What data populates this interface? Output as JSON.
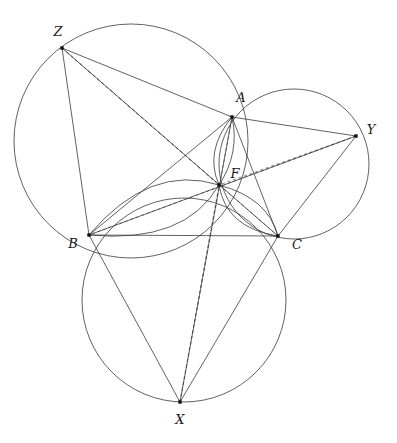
{
  "figure": {
    "width": 397,
    "height": 443,
    "background_color": "#ffffff",
    "stroke_color": "#3a3a3a",
    "dashed_color": "#6a6a6a",
    "vertex_color": "#111111"
  },
  "points": {
    "A": {
      "label": "A",
      "x": 232,
      "y": 117,
      "label_x": 241,
      "label_y": 98
    },
    "B": {
      "label": "B",
      "x": 89,
      "y": 235,
      "label_x": 73,
      "label_y": 244
    },
    "C": {
      "label": "C",
      "x": 278,
      "y": 236,
      "label_x": 297,
      "label_y": 245
    },
    "X": {
      "label": "X",
      "x": 180,
      "y": 402,
      "label_x": 180,
      "label_y": 420
    },
    "Y": {
      "label": "Y",
      "x": 356,
      "y": 136,
      "label_x": 371,
      "label_y": 130
    },
    "Z": {
      "label": "Z",
      "x": 62,
      "y": 48,
      "label_x": 58,
      "label_y": 32
    },
    "F": {
      "label": "F",
      "x": 219,
      "y": 185,
      "label_x": 235,
      "label_y": 174
    }
  },
  "circles": [
    {
      "name": "circumcircle-ABZ",
      "cx": 131,
      "cy": 141,
      "r": 117
    },
    {
      "name": "circumcircle-ACY",
      "cx": 294,
      "cy": 164,
      "r": 75
    },
    {
      "name": "circumcircle-BCX",
      "cx": 184,
      "cy": 300,
      "r": 102
    }
  ],
  "arcs": [
    {
      "name": "arc-BF-upper",
      "d": "M 89 235 Q 150 163 219 185"
    },
    {
      "name": "arc-BF-lower",
      "d": "M 89 235 Q 185 244 219 185"
    },
    {
      "name": "arc-FC-upper",
      "d": "M 219 185 Q 268 198 278 236"
    },
    {
      "name": "arc-FC-lower",
      "d": "M 219 185 Q 226 228 278 236"
    },
    {
      "name": "arc-AF-left",
      "d": "M 232 117 Q 204 151 219 185"
    },
    {
      "name": "arc-AF-right",
      "d": "M 232 117 Q 240 153 219 185"
    }
  ],
  "solid_segments": [
    {
      "name": "segment-AB",
      "from": "A",
      "to": "B"
    },
    {
      "name": "segment-BC",
      "from": "B",
      "to": "C"
    },
    {
      "name": "segment-CA",
      "from": "C",
      "to": "A"
    },
    {
      "name": "segment-ZA",
      "from": "Z",
      "to": "A"
    },
    {
      "name": "segment-ZB",
      "from": "Z",
      "to": "B"
    },
    {
      "name": "segment-AY",
      "from": "A",
      "to": "Y"
    },
    {
      "name": "segment-CY",
      "from": "C",
      "to": "Y"
    },
    {
      "name": "segment-BX",
      "from": "B",
      "to": "X"
    },
    {
      "name": "segment-CX",
      "from": "C",
      "to": "X"
    },
    {
      "name": "cevian-AX",
      "from": "A",
      "to": "X"
    },
    {
      "name": "cevian-BY",
      "from": "B",
      "to": "Y"
    },
    {
      "name": "cevian-CZ",
      "from": "C",
      "to": "Z"
    }
  ],
  "dashed_segments": [
    {
      "name": "dashed-ZF",
      "from": "Z",
      "to": "F"
    },
    {
      "name": "dashed-ZC",
      "from": "Z",
      "to": "C"
    },
    {
      "name": "dashed-YF",
      "from": "Y",
      "to": "F"
    },
    {
      "name": "dashed-YB",
      "from": "Y",
      "to": "B"
    },
    {
      "name": "dashed-XF",
      "from": "X",
      "to": "F"
    },
    {
      "name": "dashed-XA",
      "from": "X",
      "to": "A"
    }
  ],
  "labels": {
    "A": "A",
    "B": "B",
    "C": "C",
    "X": "X",
    "Y": "Y",
    "Z": "Z",
    "F": "F"
  }
}
